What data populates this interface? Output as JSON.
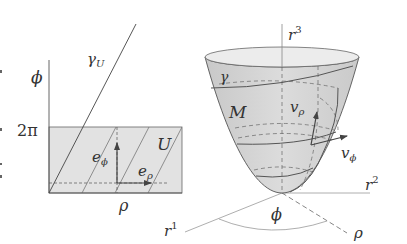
{
  "left_panel": {
    "axis_phi_label": "ϕ",
    "tick_2pi_label": "2π",
    "axis_rho_label": "ρ",
    "curve_label": "γ",
    "curve_label_sub": "U",
    "region_label": "U",
    "basis_phi_label": "e",
    "basis_phi_sub": "ϕ",
    "basis_rho_label": "e",
    "basis_rho_sub": "ρ",
    "shade_color": "#e0e0e0",
    "line_color": "#555555"
  },
  "right_panel": {
    "axis_r3_label": "r",
    "axis_r3_sup": "3",
    "axis_r2_label": "r",
    "axis_r2_sup": "2",
    "axis_r1_label": "r",
    "axis_r1_sup": "1",
    "curve_label": "γ",
    "surface_label": "M",
    "vec_rho_label": "v",
    "vec_rho_sub": "ρ",
    "vec_phi_label": "v",
    "vec_phi_sub": "ϕ",
    "angle_label": "ϕ",
    "radial_label": "ρ",
    "surface_color": "#d6d6d6"
  }
}
